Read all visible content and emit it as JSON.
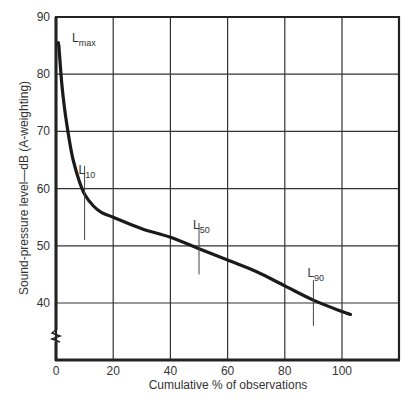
{
  "chart_data": {
    "type": "line",
    "title": "",
    "xlabel": "Cumulative % of observations",
    "ylabel": "Sound-pressure level—dB (A-weighting)",
    "xlim": [
      0,
      120
    ],
    "ylim": [
      30,
      90
    ],
    "y_axis_break": true,
    "grid": true,
    "x_ticks": [
      0,
      20,
      40,
      60,
      80,
      100
    ],
    "y_ticks": [
      40,
      50,
      60,
      70,
      80,
      90
    ],
    "series": [
      {
        "name": "Cumulative distribution of sound level",
        "x": [
          1,
          2,
          3,
          4,
          5,
          6,
          8,
          10,
          13,
          16,
          20,
          30,
          40,
          50,
          60,
          70,
          80,
          90,
          100,
          103
        ],
        "y": [
          85,
          78.5,
          74,
          70.5,
          67.5,
          65,
          61.5,
          59,
          57,
          55.8,
          55,
          53,
          51.5,
          49.5,
          47.5,
          45.5,
          43,
          40.5,
          38.5,
          38
        ]
      }
    ],
    "annotations": [
      {
        "label": "L",
        "subscript": "max",
        "x": 4,
        "y": 86.5,
        "marker": false
      },
      {
        "label": "L",
        "subscript": "10",
        "x": 10,
        "y": 59,
        "label_y": 62.5,
        "marker_range": [
          51,
          64
        ]
      },
      {
        "label": "L",
        "subscript": "50",
        "x": 50,
        "y": 49.5,
        "label_y": 53,
        "marker_range": [
          45,
          54
        ]
      },
      {
        "label": "L",
        "subscript": "90",
        "x": 90,
        "y": 40.5,
        "label_y": 44.5,
        "marker_range": [
          36,
          44
        ]
      }
    ]
  }
}
